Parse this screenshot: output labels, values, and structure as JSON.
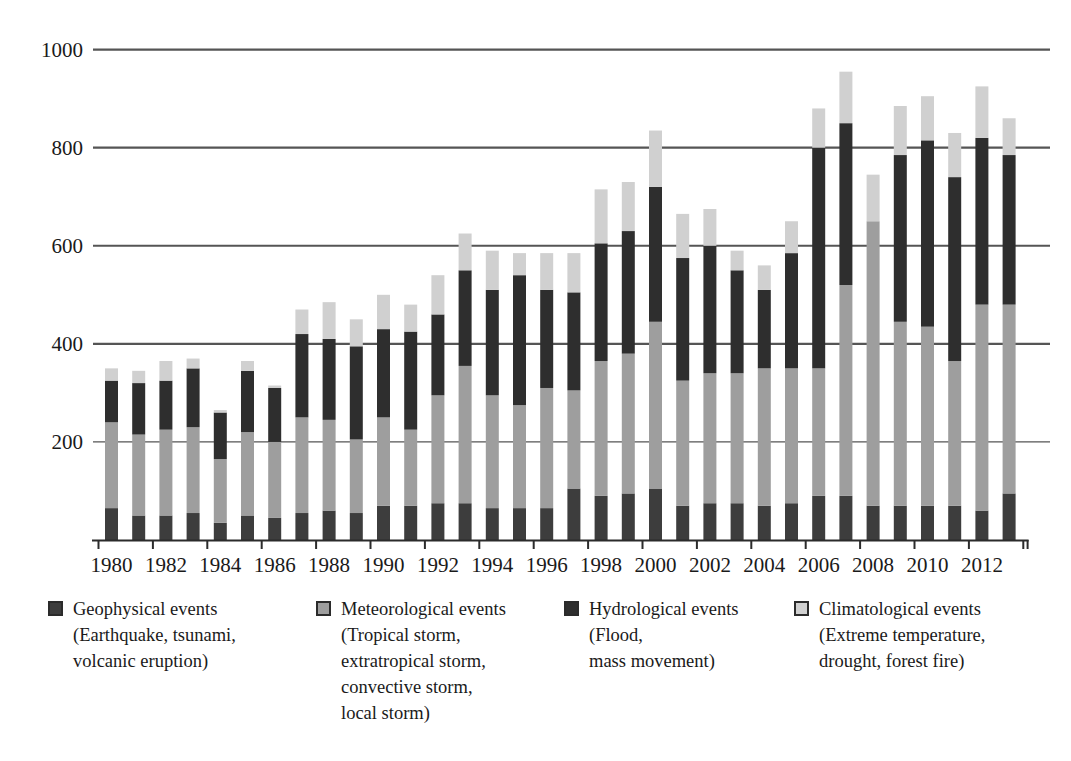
{
  "chart_data": {
    "type": "bar",
    "subtype": "stacked-bar",
    "title": "",
    "subtitle": "",
    "xlabel": "",
    "ylabel": "",
    "ylim": [
      0,
      1040
    ],
    "yticks": [
      200,
      400,
      600,
      800,
      1000
    ],
    "ytick_labels": [
      "200",
      "400",
      "600",
      "800",
      "1000"
    ],
    "grid": "horizontal",
    "legend_position": "bottom",
    "stack_order_bottom_to_top": [
      "Geophysical events",
      "Meteorological events",
      "Hydrological events",
      "Climatological events"
    ],
    "categories": [
      1980,
      1981,
      1982,
      1983,
      1984,
      1985,
      1986,
      1987,
      1988,
      1989,
      1990,
      1991,
      1992,
      1993,
      1994,
      1995,
      1996,
      1997,
      1998,
      1999,
      2000,
      2001,
      2002,
      2003,
      2004,
      2005,
      2006,
      2007,
      2008,
      2009,
      2010,
      2011,
      2012,
      2013
    ],
    "x": [
      1980,
      1981,
      1982,
      1983,
      1984,
      1985,
      1986,
      1987,
      1988,
      1989,
      1990,
      1991,
      1992,
      1993,
      1994,
      1995,
      1996,
      1997,
      1998,
      1999,
      2000,
      2001,
      2002,
      2003,
      2004,
      2005,
      2006,
      2007,
      2008,
      2009,
      2010,
      2011,
      2012,
      2013
    ],
    "xtick_labels": [
      "1980",
      "1982",
      "1984",
      "1986",
      "1988",
      "1990",
      "1992",
      "1994",
      "1996",
      "1998",
      "2000",
      "2002",
      "2004",
      "2006",
      "2008",
      "2010",
      "2012"
    ],
    "series": [
      {
        "name": "Geophysical events",
        "color": "#3d3d3d",
        "values": [
          65,
          50,
          50,
          55,
          35,
          50,
          45,
          55,
          60,
          55,
          70,
          70,
          75,
          75,
          65,
          65,
          65,
          105,
          90,
          95,
          105,
          70,
          75,
          75,
          70,
          75,
          90,
          90,
          70,
          70,
          70,
          70,
          60,
          95
        ]
      },
      {
        "name": "Meteorological events",
        "color": "#9e9e9e",
        "values": [
          175,
          165,
          175,
          175,
          130,
          170,
          155,
          195,
          185,
          150,
          180,
          155,
          220,
          280,
          230,
          210,
          245,
          200,
          275,
          285,
          340,
          255,
          265,
          265,
          280,
          275,
          260,
          430,
          580,
          375,
          365,
          295,
          420,
          385
        ]
      },
      {
        "name": "Hydrological events",
        "color": "#2e2e2e",
        "values": [
          85,
          105,
          100,
          120,
          95,
          125,
          110,
          170,
          165,
          190,
          180,
          200,
          165,
          195,
          215,
          265,
          200,
          200,
          240,
          250,
          275,
          250,
          260,
          210,
          160,
          235,
          450,
          330,
          0,
          340,
          380,
          375,
          340,
          305
        ]
      },
      {
        "name": "Climatological events",
        "color": "#d0d0d0",
        "values": [
          25,
          25,
          40,
          20,
          5,
          20,
          5,
          50,
          75,
          55,
          70,
          55,
          80,
          75,
          80,
          45,
          75,
          80,
          110,
          100,
          115,
          90,
          75,
          40,
          50,
          65,
          80,
          105,
          95,
          100,
          90,
          90,
          105,
          75
        ]
      }
    ],
    "totals": [
      350,
      345,
      365,
      370,
      265,
      365,
      315,
      470,
      485,
      450,
      500,
      480,
      540,
      625,
      590,
      585,
      585,
      585,
      715,
      730,
      835,
      665,
      675,
      590,
      560,
      650,
      880,
      955,
      745,
      885,
      905,
      830,
      925,
      860
    ]
  },
  "legend": {
    "items": [
      {
        "swatch_color": "#3d3d3d",
        "label": "Geophysical events\n(Earthquake, tsunami,\nvolcanic eruption)"
      },
      {
        "swatch_color": "#9e9e9e",
        "label": "Meteorological events\n(Tropical storm,\nextratropical storm,\nconvective storm,\nlocal storm)"
      },
      {
        "swatch_color": "#2e2e2e",
        "label": "Hydrological events\n(Flood,\nmass movement)"
      },
      {
        "swatch_color": "#d0d0d0",
        "label": "Climatological events\n(Extreme temperature,\ndrought, forest fire)"
      }
    ]
  },
  "colors": {
    "geophysical": "#3d3d3d",
    "meteorological": "#9e9e9e",
    "hydrological": "#2e2e2e",
    "climatological": "#d0d0d0",
    "axis": "#2b2b2b",
    "grid": "#555555",
    "background": "#ffffff"
  }
}
